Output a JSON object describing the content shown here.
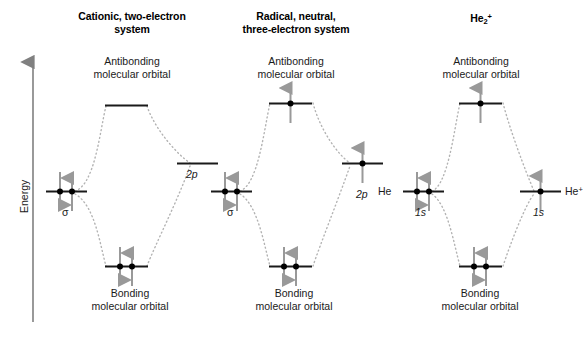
{
  "figure": {
    "axis": {
      "label": "Energy",
      "arrow_color": "#808080"
    },
    "colors": {
      "level_line": "#1a1a1a",
      "dotted_correlation": "#b3b3b3",
      "electron_arrow": "#999999",
      "electron_dot": "#000000",
      "text": "#1a1a1a"
    },
    "captions": {
      "antibonding_line1": "Antibonding",
      "antibonding_line2": "molecular orbital",
      "bonding_line1": "Bonding",
      "bonding_line2": "molecular orbital"
    },
    "panels": [
      {
        "id": "panel-cationic",
        "title_line1": "Cationic, two-electron",
        "title_line2": "system",
        "title_html": "Cationic, two-electron<br>system",
        "left_orbital_label": "σ",
        "left_orbital_label_italic": false,
        "right_orbital_label": "2p",
        "right_orbital_label_italic": true,
        "left_electrons": 2,
        "right_electrons": 0,
        "antibonding_electrons": 0,
        "bonding_electrons": 2
      },
      {
        "id": "panel-radical",
        "title_line1": "Radical, neutral,",
        "title_line2": "three-electron system",
        "title_html": "Radical, neutral,<br>three-electron system",
        "left_orbital_label": "σ",
        "left_orbital_label_italic": false,
        "right_orbital_label": "2p",
        "right_orbital_label_italic": true,
        "left_electrons": 2,
        "right_electrons": 1,
        "antibonding_electrons": 1,
        "bonding_electrons": 2
      },
      {
        "id": "panel-he2-cation",
        "title_line1": "He2+",
        "title_line2": "",
        "title_html": "He<span class=\"sub\">2</span><span class=\"sup\">+</span>",
        "left_atom_label": "He",
        "right_atom_label_html": "He<span class=\"sup\">+</span>",
        "left_orbital_label": "1s",
        "left_orbital_label_italic": true,
        "right_orbital_label": "1s",
        "right_orbital_label_italic": true,
        "left_electrons": 2,
        "right_electrons": 1,
        "antibonding_electrons": 1,
        "bonding_electrons": 2
      }
    ]
  }
}
